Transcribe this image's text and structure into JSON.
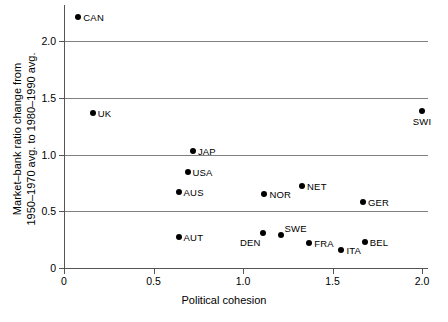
{
  "chart_data": {
    "type": "scatter",
    "title": "",
    "xlabel": "Political cohesion",
    "ylabel_line1": "Market–bank ratio change from",
    "ylabel_line2": "1950–1970 avg. to 1980–1990 avg.",
    "xlim": [
      0,
      2.0
    ],
    "ylim": [
      0,
      2.3
    ],
    "xticks": [
      "0",
      "0.5",
      "1.0",
      "1.5",
      "2.0"
    ],
    "xtick_values": [
      0,
      0.5,
      1.0,
      1.5,
      2.0
    ],
    "yticks": [
      "0",
      "0.5",
      "1.0",
      "1.5",
      "2.0"
    ],
    "ytick_values": [
      0,
      0.5,
      1.0,
      1.5,
      2.0
    ],
    "grid": "horizontal",
    "legend": "none",
    "points": [
      {
        "label": "CAN",
        "x": 0.08,
        "y": 2.21,
        "label_pos": "right"
      },
      {
        "label": "UK",
        "x": 0.16,
        "y": 1.37,
        "label_pos": "right"
      },
      {
        "label": "SWI",
        "x": 2.0,
        "y": 1.38,
        "label_pos": "below"
      },
      {
        "label": "JAP",
        "x": 0.72,
        "y": 1.03,
        "label_pos": "right"
      },
      {
        "label": "USA",
        "x": 0.69,
        "y": 0.85,
        "label_pos": "right"
      },
      {
        "label": "AUS",
        "x": 0.64,
        "y": 0.67,
        "label_pos": "right"
      },
      {
        "label": "NET",
        "x": 1.33,
        "y": 0.72,
        "label_pos": "right"
      },
      {
        "label": "NOR",
        "x": 1.12,
        "y": 0.65,
        "label_pos": "right"
      },
      {
        "label": "GER",
        "x": 1.67,
        "y": 0.58,
        "label_pos": "right"
      },
      {
        "label": "DEN",
        "x": 1.11,
        "y": 0.31,
        "label_pos": "belowleft"
      },
      {
        "label": "SWE",
        "x": 1.21,
        "y": 0.29,
        "label_pos": "aboveright"
      },
      {
        "label": "AUT",
        "x": 0.64,
        "y": 0.27,
        "label_pos": "right"
      },
      {
        "label": "BEL",
        "x": 1.68,
        "y": 0.23,
        "label_pos": "right"
      },
      {
        "label": "FRA",
        "x": 1.37,
        "y": 0.22,
        "label_pos": "right"
      },
      {
        "label": "ITA",
        "x": 1.55,
        "y": 0.16,
        "label_pos": "right"
      }
    ]
  }
}
